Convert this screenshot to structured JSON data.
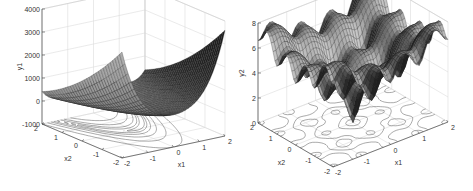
{
  "chart_data": [
    {
      "type": "surface3d",
      "title": "",
      "function_hint": "Rosenbrock-like valley surface",
      "xlabel": "x1",
      "ylabel": "x2",
      "zlabel": "y1",
      "xlim": [
        -2,
        2
      ],
      "ylim": [
        -2,
        2
      ],
      "zlim": [
        -1000,
        4000
      ],
      "xticks": [
        "-2",
        "-1",
        "0",
        "1",
        "2"
      ],
      "yticks": [
        "-2",
        "-1",
        "0",
        "1",
        "2"
      ],
      "zticks": [
        "-1000",
        "0",
        "1000",
        "2000",
        "3000",
        "4000"
      ],
      "grid": true,
      "colormap": "gray",
      "contour_base": true,
      "surface_samples": {
        "corners": {
          "x1=-2,x2=-2": 3600,
          "x1=2,x2=-2": 3600,
          "x1=-2,x2=2": 400,
          "x1=2,x2=2": 400
        },
        "min_approx": 0
      }
    },
    {
      "type": "surface3d",
      "title": "",
      "function_hint": "Ackley-like multimodal surface",
      "xlabel": "x1",
      "ylabel": "x2",
      "zlabel": "y2",
      "xlim": [
        -2,
        2
      ],
      "ylim": [
        -2,
        2
      ],
      "zlim": [
        0,
        8
      ],
      "xticks": [
        "-2",
        "-1",
        "0",
        "1",
        "2"
      ],
      "yticks": [
        "-2",
        "-1",
        "0",
        "1",
        "2"
      ],
      "zticks": [
        "0",
        "2",
        "4",
        "6",
        "8"
      ],
      "grid": true,
      "colormap": "gray",
      "contour_base": true,
      "surface_samples": {
        "center_min": 0,
        "peak_approx": 7.5
      }
    }
  ]
}
